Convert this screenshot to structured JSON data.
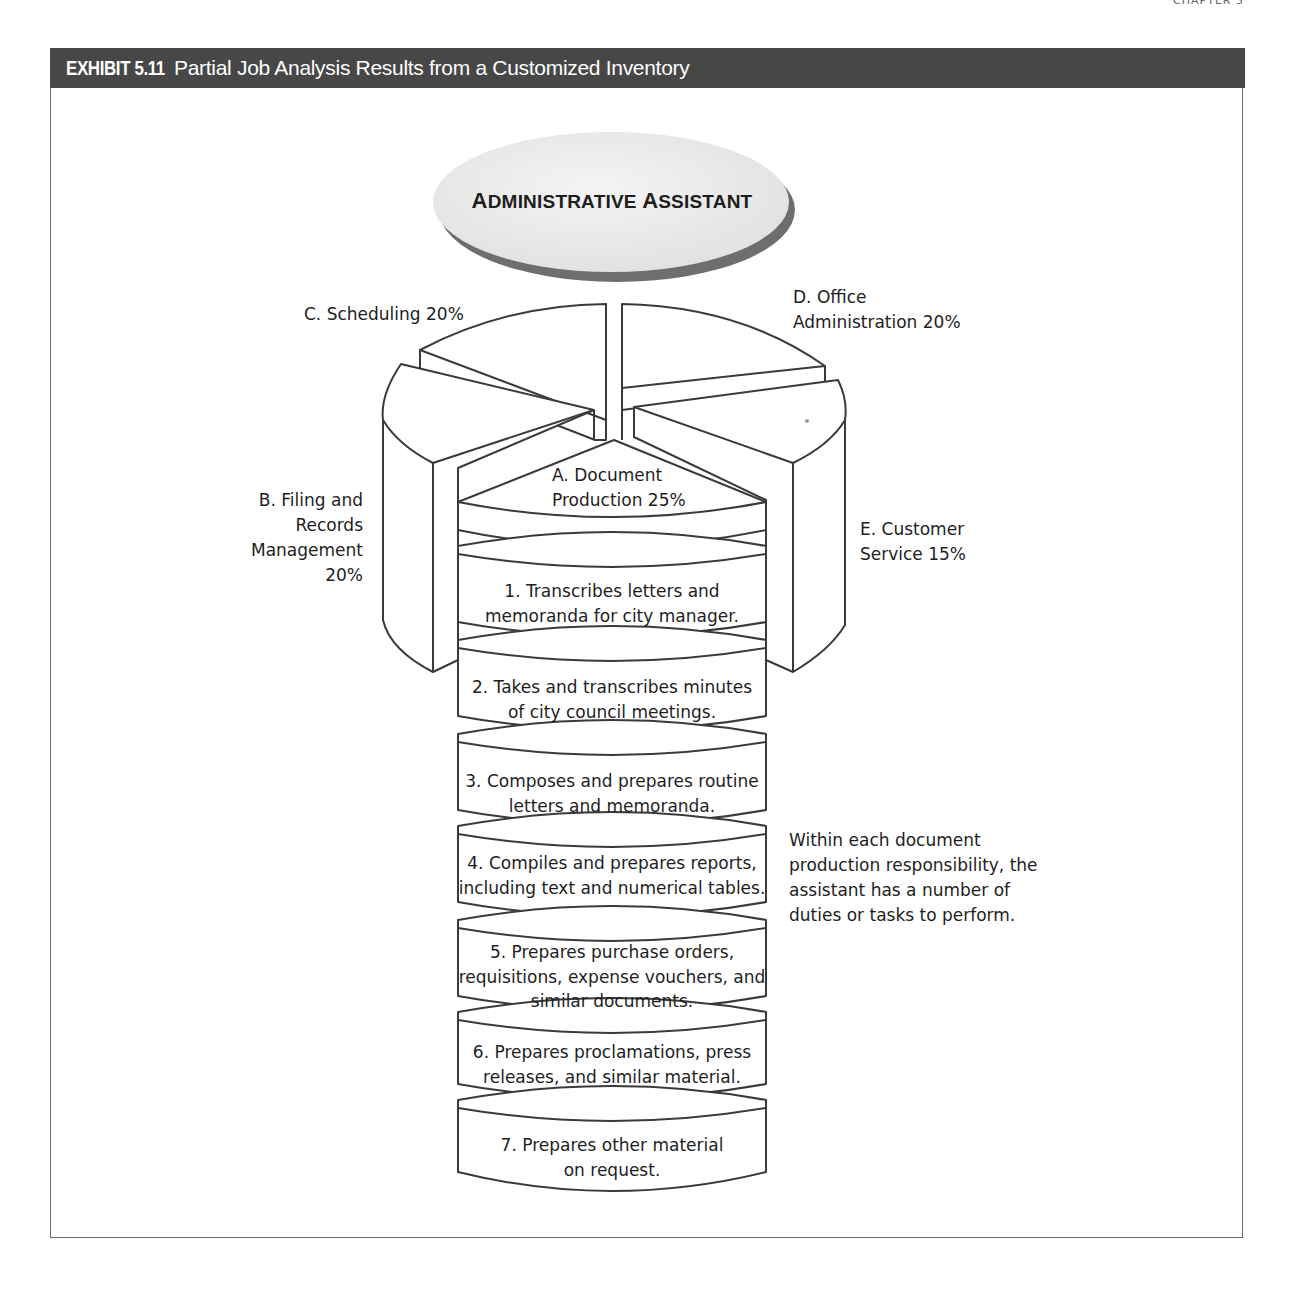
{
  "running_head": "CHAPTER 5",
  "exhibit": {
    "number": "EXHIBIT 5.11",
    "title": "Partial Job Analysis Results from a Customized Inventory",
    "bar_color": "#474747"
  },
  "diagram": {
    "job_title": "Administrative Assistant",
    "job_title_parts": [
      {
        "big": "A",
        "rest": "DMINISTRATIVE "
      },
      {
        "big": "A",
        "rest": "SSISTANT"
      }
    ],
    "responsibilities": [
      {
        "id": "A",
        "label": "A. Document",
        "label2": "Production 25%",
        "percent": 25
      },
      {
        "id": "B",
        "label_lines": [
          "B. Filing and",
          "Records",
          "Management",
          "20%"
        ],
        "percent": 20
      },
      {
        "id": "C",
        "label": "C. Scheduling 20%",
        "percent": 20
      },
      {
        "id": "D",
        "label_lines": [
          "D. Office",
          "Administration 20%"
        ],
        "percent": 20
      },
      {
        "id": "E",
        "label_lines": [
          "E. Customer",
          "Service 15%"
        ],
        "percent": 15
      }
    ],
    "tasks": [
      {
        "lines": [
          "1. Transcribes letters and",
          "memoranda for city manager."
        ]
      },
      {
        "lines": [
          "2. Takes and transcribes minutes",
          "of city council meetings."
        ]
      },
      {
        "lines": [
          "3. Composes and prepares routine",
          "letters and memoranda."
        ]
      },
      {
        "lines": [
          "4. Compiles and prepares reports,",
          "including text and numerical tables."
        ]
      },
      {
        "lines": [
          "5. Prepares purchase orders,",
          "requisitions, expense vouchers, and",
          "similar documents."
        ]
      },
      {
        "lines": [
          "6. Prepares proclamations, press",
          "releases, and similar material."
        ]
      },
      {
        "lines": [
          "7. Prepares other material",
          "on request."
        ]
      }
    ],
    "annotation_lines": [
      "Within each document",
      "production responsibility, the",
      "assistant has a number of",
      "duties or tasks to perform."
    ]
  }
}
